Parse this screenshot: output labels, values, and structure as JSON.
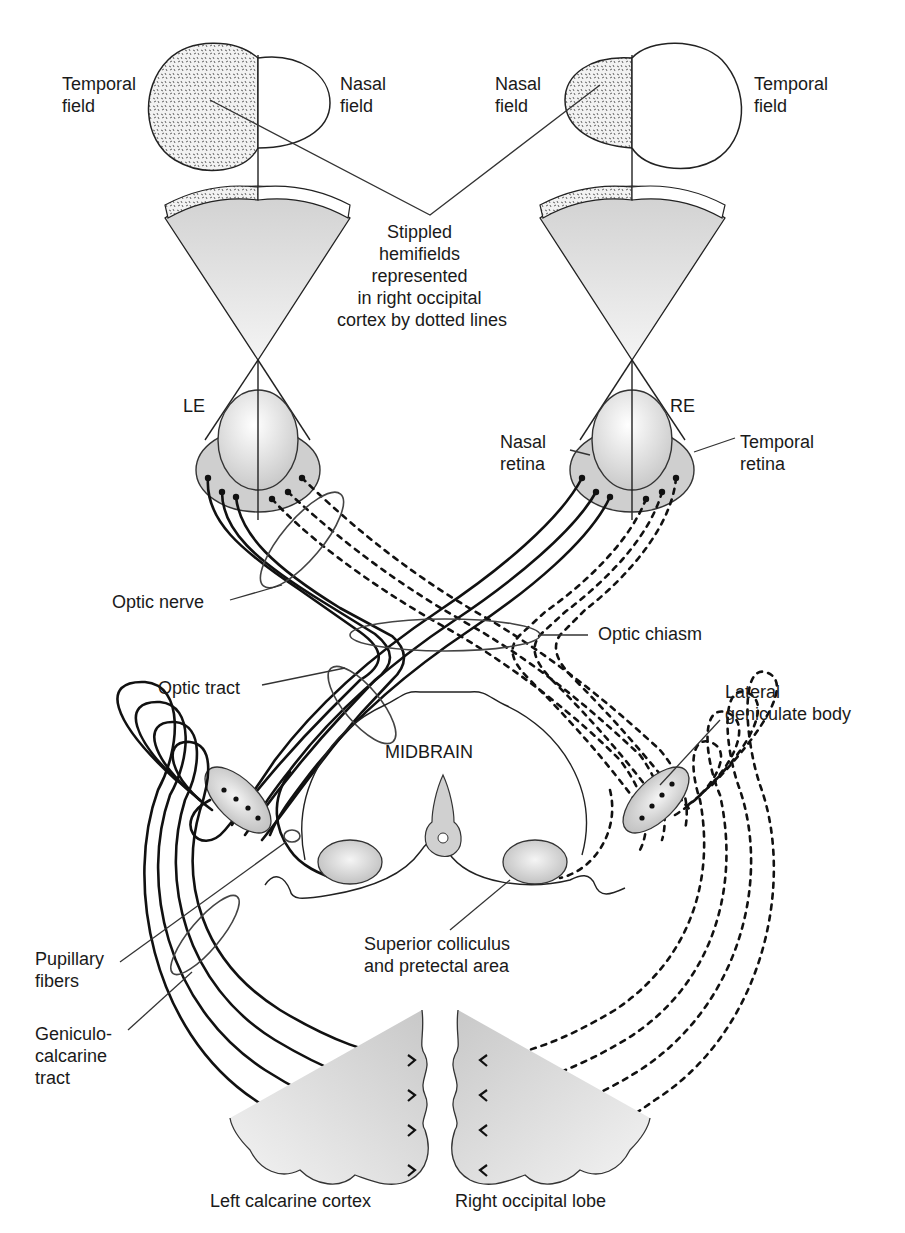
{
  "figure": {
    "labels": {
      "left_temporal_field": [
        "Temporal",
        "field"
      ],
      "left_nasal_field": [
        "Nasal",
        "field"
      ],
      "right_nasal_field": [
        "Nasal",
        "field"
      ],
      "right_temporal_field": [
        "Temporal",
        "field"
      ],
      "stippled_note": [
        "Stippled",
        "hemifields",
        "represented",
        "in right occipital",
        "cortex by dotted lines"
      ],
      "left_eye": "LE",
      "right_eye": "RE",
      "nasal_retina": [
        "Nasal",
        "retina"
      ],
      "temporal_retina": [
        "Temporal",
        "retina"
      ],
      "optic_nerve": "Optic nerve",
      "optic_chiasm": "Optic chiasm",
      "optic_tract": "Optic tract",
      "lateral_geniculate_body": [
        "Lateral",
        "geniculate body"
      ],
      "midbrain": "MIDBRAIN",
      "pupillary_fibers": [
        "Pupillary",
        "fibers"
      ],
      "geniculocalcarine_tract": [
        "Geniculo-",
        "calcarine",
        "tract"
      ],
      "superior_colliculus": [
        "Superior colliculus",
        "and pretectal area"
      ],
      "left_calcarine_cortex": "Left calcarine cortex",
      "right_occipital_lobe": "Right occipital lobe"
    },
    "legend": {
      "solid_lines": "Fibers from left visual cortex representation",
      "dotted_lines": "Fibers representing stippled hemifields (right occipital cortex)"
    },
    "colors": {
      "line": "#111111",
      "fill_gray": "#d4d4d4",
      "background": "#ffffff"
    }
  }
}
